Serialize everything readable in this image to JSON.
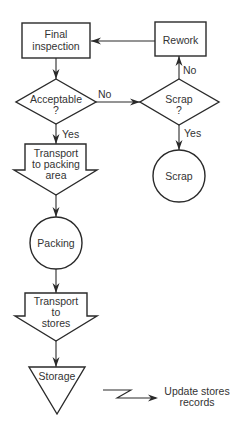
{
  "diagram": {
    "type": "flowchart",
    "nodes": {
      "final_inspection": {
        "shape": "rectangle",
        "line1": "Final",
        "line2": "inspection"
      },
      "rework": {
        "shape": "rectangle",
        "label": "Rework"
      },
      "acceptable": {
        "shape": "diamond",
        "line1": "Acceptable",
        "line2": "?"
      },
      "scrap_decision": {
        "shape": "diamond",
        "line1": "Scrap",
        "line2": "?"
      },
      "transport_packing": {
        "shape": "transport-arrow",
        "line1": "Transport",
        "line2": "to packing",
        "line3": "area"
      },
      "scrap_op": {
        "shape": "circle",
        "label": "Scrap"
      },
      "packing": {
        "shape": "circle",
        "label": "Packing"
      },
      "transport_stores": {
        "shape": "transport-arrow",
        "line1": "Transport",
        "line2": "to",
        "line3": "stores"
      },
      "storage": {
        "shape": "inverted-triangle",
        "label": "Storage"
      },
      "update_records": {
        "shape": "text",
        "line1": "Update stores",
        "line2": "records"
      }
    },
    "edges": {
      "acceptable_no": "No",
      "acceptable_yes": "Yes",
      "scrap_no": "No",
      "scrap_yes": "Yes"
    }
  }
}
